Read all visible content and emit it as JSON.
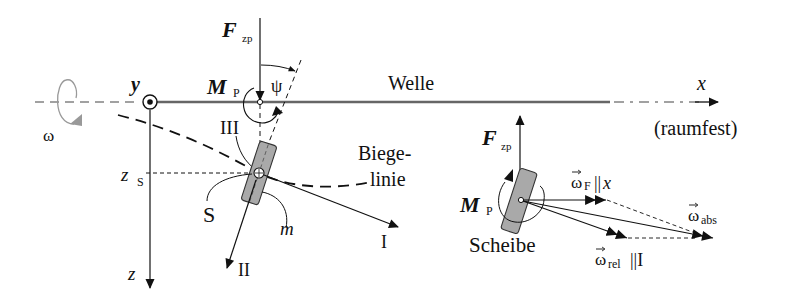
{
  "left": {
    "omega": "ω",
    "y_axis": "y",
    "z_axis": "z",
    "z_s_main": "z",
    "z_s_sub": "S",
    "f_main": "F",
    "f_sub": "zp",
    "m_main": "M",
    "m_sub": "P",
    "psi": "ψ",
    "shaft": "Welle",
    "x_axis": "x",
    "fixed": "(raumfest)",
    "axis_three": "III",
    "axis_two": "II",
    "axis_one": "I",
    "center": "S",
    "mass": "m",
    "bend_line_1": "Biege-",
    "bend_line_2": "linie"
  },
  "right": {
    "f_main": "F",
    "f_sub": "zp",
    "m_main": "M",
    "m_sub": "P",
    "disk": "Scheibe",
    "omega_f_main": "ω",
    "omega_f_sub": "F",
    "omega_f_tail": "||",
    "omega_f_axis": "x",
    "omega_abs_main": "ω",
    "omega_abs_sub": "abs",
    "omega_rel_main": "ω",
    "omega_rel_sub": "rel",
    "omega_rel_tail": "||I"
  },
  "colors": {
    "ink": "#111111",
    "disk_fill": "#a9a9a9",
    "shaft": "#555555",
    "omega_arrow": "#999999"
  }
}
